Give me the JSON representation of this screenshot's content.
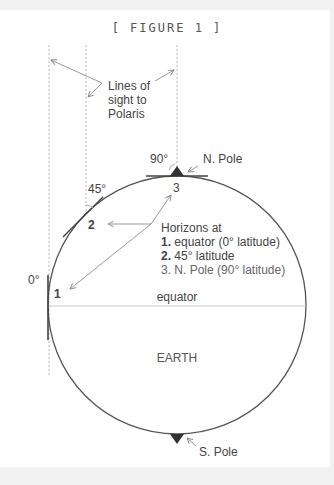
{
  "figure": {
    "title": "[ FIGURE 1 ]",
    "sightlines_label": [
      "Lines of",
      "sight to",
      "Polaris"
    ],
    "angles": {
      "equator": "0°",
      "mid": "45°",
      "pole": "90°"
    },
    "point_labels": {
      "p1": "1",
      "p2": "2",
      "p3": "3"
    },
    "north_pole_label": "N. Pole",
    "south_pole_label": "S. Pole",
    "equator_label": "equator",
    "earth_label": "EARTH",
    "legend": {
      "heading": "Horizons at",
      "items": [
        {
          "num": "1.",
          "text": " equator (0° latitude)"
        },
        {
          "num": "2.",
          "text": " 45° latitude"
        },
        {
          "num": "3.",
          "text": " N. Pole (90° latitude)"
        }
      ]
    }
  }
}
